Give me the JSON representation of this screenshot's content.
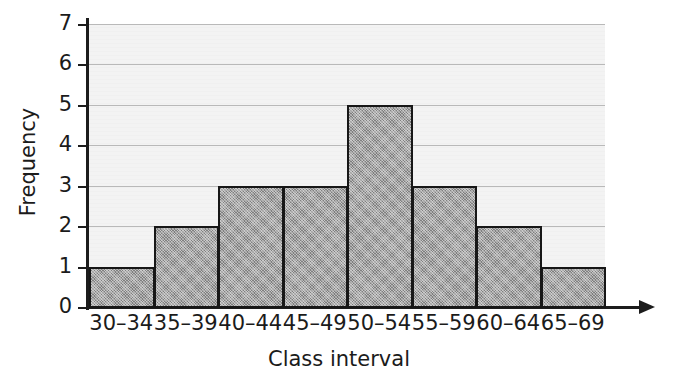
{
  "chart_data": {
    "type": "bar",
    "title": "",
    "subtitle": "",
    "xlabel": "Class interval",
    "ylabel": "Frequency",
    "categories": [
      "30–34",
      "35–39",
      "40–44",
      "45–49",
      "50–54",
      "55–59",
      "60–64",
      "65–69"
    ],
    "values": [
      1,
      2,
      3,
      3,
      5,
      3,
      2,
      1
    ],
    "ylim": [
      0,
      7
    ],
    "y_ticks": [
      0,
      1,
      2,
      3,
      4,
      5,
      6,
      7
    ],
    "y_tick_labels": [
      "0",
      "1",
      "2",
      "3",
      "4",
      "5",
      "6",
      "7"
    ],
    "grid": true,
    "grid_axis": "y",
    "legend": null,
    "bar_gap": 0,
    "colors": {
      "bar_fill": "#a5a5a5",
      "bar_edge": "#171717",
      "plot_background": "#f3f3f3",
      "page_background": "#ffffff",
      "gridline": "#b9b9b9",
      "axis": "#1c1c1c",
      "text": "#1b1b1b"
    },
    "annotations": []
  },
  "axes": {
    "x_axis_name": "x-axis",
    "y_axis_name": "y-axis",
    "x_axis_has_arrow": true
  }
}
